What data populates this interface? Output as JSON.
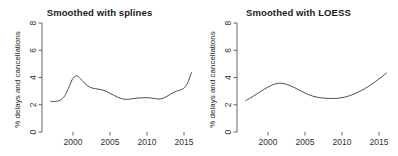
{
  "figure": {
    "background_color": "#ffffff",
    "line_color": "#4d4d4d",
    "axis_color": "#555555",
    "panel_count": 2
  },
  "panels": [
    {
      "id": "splines",
      "title": "Smoothed with splines",
      "ylabel": "% delays and cancellations"
    },
    {
      "id": "loess",
      "title": "Smoothed with LOESS",
      "ylabel": "% delays and cancellations"
    }
  ],
  "chart_data": [
    {
      "type": "line",
      "title": "Smoothed with splines",
      "xlabel": "",
      "ylabel": "% delays and cancellations",
      "xlim": [
        1996.6,
        2016.4
      ],
      "ylim": [
        0,
        8
      ],
      "xticks": [
        2000,
        2005,
        2010,
        2015
      ],
      "yticks": [
        0,
        2,
        4,
        6,
        8
      ],
      "xtick_labels": [
        "2000",
        "2005",
        "2010",
        "2015"
      ],
      "ytick_labels": [
        "0",
        "2",
        "4",
        "6",
        "8"
      ],
      "grid": false,
      "legend": false,
      "series": [
        {
          "name": "smoothed % delays and cancellations (spline)",
          "x": [
            1997.0,
            1997.5,
            1998.0,
            1998.5,
            1999.0,
            1999.5,
            2000.0,
            2000.5,
            2001.0,
            2001.5,
            2002.0,
            2002.5,
            2003.0,
            2003.5,
            2004.0,
            2004.5,
            2005.0,
            2005.5,
            2006.0,
            2006.5,
            2007.0,
            2007.5,
            2008.0,
            2008.5,
            2009.0,
            2009.5,
            2010.0,
            2010.5,
            2011.0,
            2011.5,
            2012.0,
            2012.5,
            2013.0,
            2013.5,
            2014.0,
            2014.5,
            2015.0,
            2015.5,
            2016.0
          ],
          "y": [
            2.25,
            2.24,
            2.28,
            2.42,
            2.75,
            3.35,
            3.95,
            4.12,
            3.92,
            3.62,
            3.38,
            3.24,
            3.18,
            3.14,
            3.08,
            2.98,
            2.84,
            2.7,
            2.56,
            2.46,
            2.4,
            2.4,
            2.44,
            2.48,
            2.5,
            2.51,
            2.52,
            2.5,
            2.46,
            2.42,
            2.45,
            2.56,
            2.72,
            2.88,
            3.0,
            3.08,
            3.22,
            3.62,
            4.35
          ]
        }
      ]
    },
    {
      "type": "line",
      "title": "Smoothed with LOESS",
      "xlabel": "",
      "ylabel": "% delays and cancellations",
      "xlim": [
        1996.6,
        2016.4
      ],
      "ylim": [
        0,
        8
      ],
      "xticks": [
        2000,
        2005,
        2010,
        2015
      ],
      "yticks": [
        0,
        2,
        4,
        6,
        8
      ],
      "xtick_labels": [
        "2000",
        "2005",
        "2010",
        "2015"
      ],
      "ytick_labels": [
        "0",
        "2",
        "4",
        "6",
        "8"
      ],
      "grid": false,
      "legend": false,
      "series": [
        {
          "name": "smoothed % delays and cancellations (LOESS)",
          "x": [
            1997.0,
            1997.5,
            1998.0,
            1998.5,
            1999.0,
            1999.5,
            2000.0,
            2000.5,
            2001.0,
            2001.5,
            2002.0,
            2002.5,
            2003.0,
            2003.5,
            2004.0,
            2004.5,
            2005.0,
            2005.5,
            2006.0,
            2006.5,
            2007.0,
            2007.5,
            2008.0,
            2008.5,
            2009.0,
            2009.5,
            2010.0,
            2010.5,
            2011.0,
            2011.5,
            2012.0,
            2012.5,
            2013.0,
            2013.5,
            2014.0,
            2014.5,
            2015.0,
            2015.5,
            2016.0
          ],
          "y": [
            2.32,
            2.46,
            2.62,
            2.8,
            2.98,
            3.14,
            3.3,
            3.44,
            3.53,
            3.58,
            3.56,
            3.5,
            3.4,
            3.28,
            3.14,
            3.0,
            2.86,
            2.74,
            2.64,
            2.57,
            2.52,
            2.49,
            2.47,
            2.46,
            2.46,
            2.48,
            2.52,
            2.58,
            2.66,
            2.76,
            2.88,
            3.01,
            3.16,
            3.32,
            3.5,
            3.7,
            3.9,
            4.1,
            4.32
          ]
        }
      ]
    }
  ]
}
